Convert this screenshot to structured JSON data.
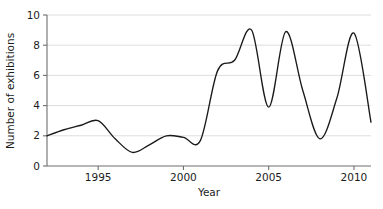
{
  "chart_data": {
    "type": "line",
    "title": "",
    "xlabel": "Year",
    "ylabel": "Number of exhibitions",
    "xlim": [
      1992,
      2011
    ],
    "ylim": [
      0,
      10
    ],
    "xticks": [
      1995,
      2000,
      2005,
      2010
    ],
    "xtick_labels": [
      "1995",
      "2000",
      "2005",
      "2010"
    ],
    "yticks": [
      0,
      2,
      4,
      6,
      8,
      10
    ],
    "ytick_labels": [
      "0",
      "2",
      "4",
      "6",
      "8",
      "10"
    ],
    "grid": "horizontal",
    "legend": "none",
    "line_color": "#1a1a1a",
    "grid_color": "#d9d9d9",
    "axis_color": "#6e6e6e",
    "background_color": "#ffffff",
    "x": [
      1992,
      1993,
      1994,
      1995,
      1996,
      1997,
      1998,
      1999,
      2000,
      2001,
      2002,
      2003,
      2004,
      2005,
      2006,
      2007,
      2008,
      2009,
      2010,
      2011
    ],
    "values": [
      2.0,
      2.4,
      2.7,
      3.0,
      1.8,
      0.9,
      1.4,
      2.0,
      1.9,
      1.7,
      6.3,
      7.0,
      9.0,
      3.9,
      8.9,
      5.0,
      1.8,
      4.5,
      8.8,
      2.9
    ],
    "series": [
      {
        "name": "Number of exhibitions",
        "values": [
          2.0,
          2.4,
          2.7,
          3.0,
          1.8,
          0.9,
          1.4,
          2.0,
          1.9,
          1.7,
          6.3,
          7.0,
          9.0,
          3.9,
          8.9,
          5.0,
          1.8,
          4.5,
          8.8,
          2.9
        ]
      }
    ],
    "annotations": []
  },
  "axis": {
    "y_title": "Number of exhibitions",
    "x_title": "Year"
  }
}
